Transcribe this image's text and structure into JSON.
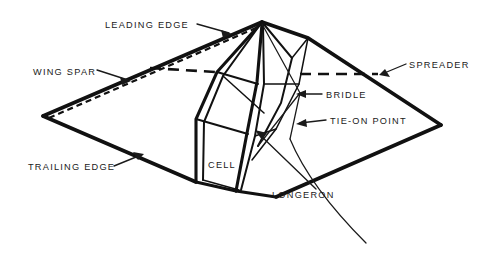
{
  "figure": {
    "background_color": "#ffffff",
    "line_color": "#111111",
    "text_color": "#1a1a1a"
  },
  "labels": {
    "leading_edge": "LEADING EDGE",
    "wing_spar": "WING SPAR",
    "trailing_edge": "TRAILING EDGE",
    "spreader": "SPREADER",
    "bridle": "BRIDLE",
    "tie_on_point": "TIE-ON POINT",
    "cell": "CELL",
    "longeron": "LONGERON"
  },
  "label_positions": {
    "leading_edge": {
      "x": 105,
      "y": 28,
      "anchor": "start"
    },
    "wing_spar": {
      "x": 33,
      "y": 75,
      "anchor": "start"
    },
    "trailing_edge": {
      "x": 28,
      "y": 168,
      "anchor": "start"
    },
    "spreader": {
      "x": 409,
      "y": 65,
      "anchor": "start"
    },
    "bridle": {
      "x": 326,
      "y": 97,
      "anchor": "start"
    },
    "tie_on_point": {
      "x": 330,
      "y": 123,
      "anchor": "start"
    },
    "cell": {
      "x": 208,
      "y": 167,
      "anchor": "start"
    },
    "longeron": {
      "x": 272,
      "y": 196,
      "anchor": "start"
    }
  },
  "geometry": {
    "apex": {
      "x": 262,
      "y": 22
    },
    "left_wing_tip": {
      "x": 43,
      "y": 116
    },
    "right_wing_tip": {
      "x": 441,
      "y": 125
    },
    "keel_bottom": {
      "x": 236,
      "y": 191
    },
    "tail_end": {
      "x": 366,
      "y": 243
    },
    "spreader_dash_y": 72,
    "spreader_dash_x_start": 150,
    "spreader_dash_x_end": 378
  }
}
